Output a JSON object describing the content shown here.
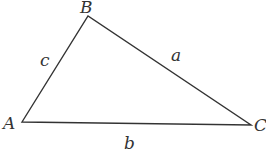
{
  "diagram": {
    "type": "triangle",
    "stroke_color": "#333333",
    "vertices": [
      {
        "name": "A",
        "x": 22,
        "y": 122
      },
      {
        "name": "B",
        "x": 88,
        "y": 16
      },
      {
        "name": "C",
        "x": 251,
        "y": 125
      }
    ],
    "sides": [
      {
        "name": "a",
        "between": "B-C"
      },
      {
        "name": "b",
        "between": "A-C"
      },
      {
        "name": "c",
        "between": "A-B"
      }
    ],
    "labels": {
      "vertex_a": "A",
      "vertex_b": "B",
      "vertex_c": "C",
      "side_a": "a",
      "side_b": "b",
      "side_c": "c"
    }
  }
}
